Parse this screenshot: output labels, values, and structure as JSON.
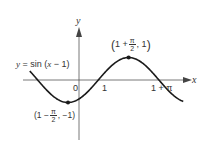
{
  "chart_data": {
    "type": "line",
    "title": "",
    "function": "y = sin(x - 1)",
    "xlabel": "x",
    "ylabel": "y",
    "grid": false,
    "legend": null,
    "x_ticks": [
      {
        "value": 0,
        "label": "0"
      },
      {
        "value": 1,
        "label": "1"
      },
      {
        "value": 4.1416,
        "label": "1 + π"
      }
    ],
    "annotations": [
      {
        "label": "y = sin (x − 1)",
        "kind": "curve-label"
      },
      {
        "label": "(1 + π/2, 1)",
        "x": 2.5708,
        "y": 1,
        "kind": "maximum-point"
      },
      {
        "label": "(1 − π/2, −1)",
        "x": -0.5708,
        "y": -1,
        "kind": "minimum-point"
      }
    ],
    "xlim": [
      -2.6,
      4.6
    ],
    "ylim": [
      -1.3,
      1.3
    ],
    "series": [
      {
        "name": "y = sin(x - 1)",
        "x": [
          -2.5,
          -2.0,
          -1.5,
          -1.0,
          -0.5708,
          0.0,
          0.5,
          1.0,
          1.5,
          2.0,
          2.5708,
          3.0,
          3.5,
          4.1416,
          4.5
        ],
        "values": [
          0.35,
          -0.14,
          -0.6,
          -0.91,
          -1.0,
          -0.84,
          -0.48,
          0.0,
          0.48,
          0.84,
          1.0,
          0.91,
          0.6,
          0.0,
          -0.35
        ]
      }
    ]
  },
  "labels": {
    "x_axis": "x",
    "y_axis": "y",
    "origin": "0",
    "tick_one": "1",
    "tick_one_plus_pi": "1 + π",
    "curve_label": "y = sin (x − 1)",
    "max_point": {
      "prefix": "1 +",
      "num": "π",
      "den": "2",
      "suffix": ", 1"
    },
    "min_point": {
      "prefix": "1 −",
      "num": "π",
      "den": "2",
      "suffix": ", −1"
    }
  },
  "colors": {
    "curve": "#1a1a1a",
    "axes": "#444444",
    "text": "#333333"
  }
}
